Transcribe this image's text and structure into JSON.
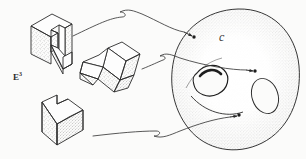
{
  "figure": {
    "caption_domain": "mathematical-diagram",
    "background_color": "#fbfbfa",
    "ink_color": "#2b2b2b",
    "stipple_color": "#6e6e6e",
    "width": 306,
    "height": 159
  },
  "labels": {
    "space_label_base": "E",
    "space_label_exponent": "3",
    "manifold_label": "c"
  },
  "objects": {
    "block_top_left": "l-shaped-block-orientation-1",
    "block_middle": "l-shaped-block-orientation-2",
    "block_bottom_left": "l-shaped-block-orientation-3",
    "manifold": "torus-surface"
  },
  "arrows": [
    {
      "name": "arrow-top",
      "from": "block_top_left",
      "to": "torus-point-upper"
    },
    {
      "name": "arrow-middle",
      "from": "block_middle",
      "to": "torus-point-center"
    },
    {
      "name": "arrow-bottom",
      "from": "block_bottom_left",
      "to": "torus-point-lower"
    }
  ],
  "points": [
    {
      "name": "torus-point-upper",
      "x": 193,
      "y": 36
    },
    {
      "name": "torus-point-center",
      "x": 255,
      "y": 71
    },
    {
      "name": "torus-point-lower",
      "x": 240,
      "y": 115
    }
  ]
}
